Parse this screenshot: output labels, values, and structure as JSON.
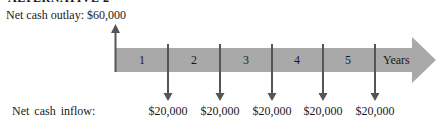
{
  "title": "ALTERNATIVE 2",
  "outlay": {
    "label": "Net cash outlay: $60,000"
  },
  "timeline": {
    "periods": [
      "1",
      "2",
      "3",
      "4",
      "5"
    ],
    "unit_label": "Years",
    "band_color": "#a9a9a9",
    "arrow_color": "#555555"
  },
  "inflows": {
    "label": "Net  cash inflow:",
    "values": [
      "$20,000",
      "$20,000",
      "$20,000",
      "$20,000",
      "$20,000"
    ]
  }
}
